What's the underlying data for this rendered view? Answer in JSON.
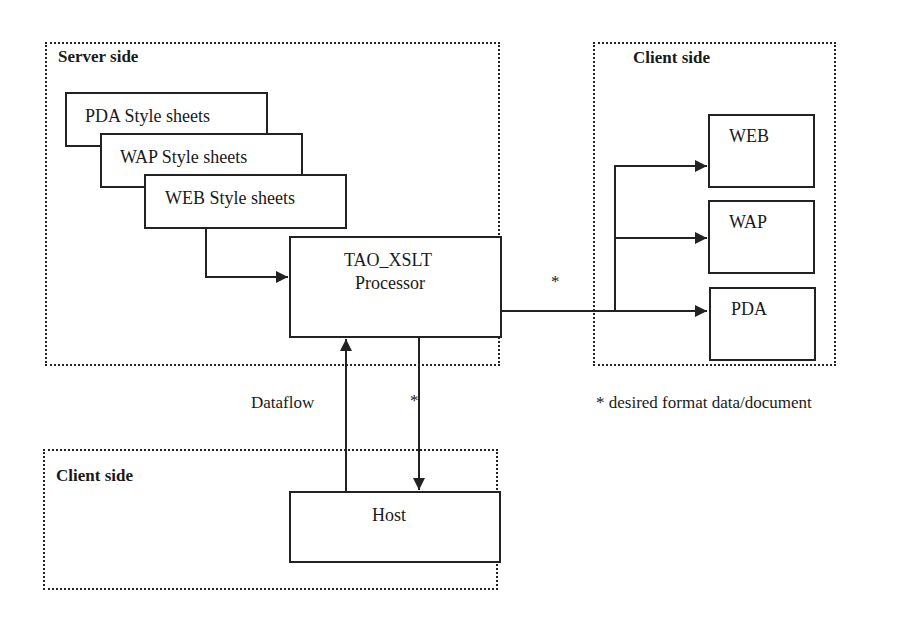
{
  "diagram": {
    "server_zone": {
      "label": "Server side"
    },
    "client_right_zone": {
      "label": "Client side"
    },
    "client_bottom_zone": {
      "label": "Client side"
    },
    "stylesheets": [
      {
        "label": "PDA Style sheets"
      },
      {
        "label": "WAP Style sheets"
      },
      {
        "label": "WEB Style sheets"
      }
    ],
    "processor": {
      "line1": "TAO_XSLT",
      "line2": "Processor"
    },
    "clients": [
      {
        "label": "WEB"
      },
      {
        "label": "WAP"
      },
      {
        "label": "PDA"
      }
    ],
    "host": {
      "label": "Host"
    },
    "edge_labels": {
      "output_star": "*",
      "host_star": "*",
      "dataflow": "Dataflow"
    },
    "footnote": "* desired format data/document",
    "colors": {
      "line": "#222222",
      "background": "#ffffff"
    }
  }
}
